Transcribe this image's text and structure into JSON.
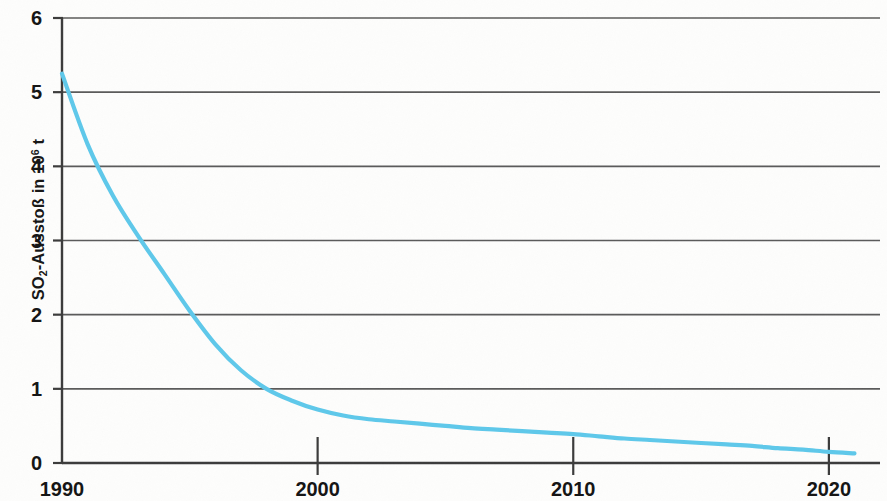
{
  "chart_data": {
    "type": "line",
    "title": "",
    "subtitle": "",
    "xlabel": "",
    "ylabel": "SO2-Ausstoß in 10^6 t",
    "ylabel_parts": {
      "prefix": "SO",
      "sub": "2",
      "middle": "-Ausstoß in 10",
      "sup": "6",
      "suffix": " t"
    },
    "xlim": [
      1990,
      2022
    ],
    "ylim": [
      0,
      6
    ],
    "grid": "horizontal",
    "legend": "none",
    "series_color": "#5ec8ea",
    "x_ticks": [
      1990,
      2000,
      2010,
      2020
    ],
    "x_tick_labels": [
      "1990",
      "2000",
      "2010",
      "2020"
    ],
    "y_ticks": [
      0,
      1,
      2,
      3,
      4,
      5,
      6
    ],
    "y_tick_labels": [
      "0",
      "1",
      "2",
      "3",
      "4",
      "5",
      "6"
    ],
    "series": [
      {
        "name": "SO2-Ausstoß",
        "x": [
          1990,
          1991,
          1992,
          1993,
          1994,
          1995,
          1996,
          1997,
          1998,
          1999,
          2000,
          2001,
          2002,
          2003,
          2004,
          2005,
          2006,
          2007,
          2008,
          2009,
          2010,
          2011,
          2012,
          2013,
          2014,
          2015,
          2016,
          2017,
          2018,
          2019,
          2020,
          2021
        ],
        "values": [
          5.25,
          4.3,
          3.6,
          3.05,
          2.55,
          2.05,
          1.6,
          1.25,
          1.0,
          0.84,
          0.72,
          0.64,
          0.59,
          0.56,
          0.53,
          0.5,
          0.47,
          0.45,
          0.43,
          0.41,
          0.39,
          0.36,
          0.33,
          0.31,
          0.29,
          0.27,
          0.25,
          0.23,
          0.2,
          0.18,
          0.15,
          0.13
        ]
      }
    ]
  },
  "axes": {
    "y_title_text": "SO2-Ausstoß in 106 t"
  }
}
